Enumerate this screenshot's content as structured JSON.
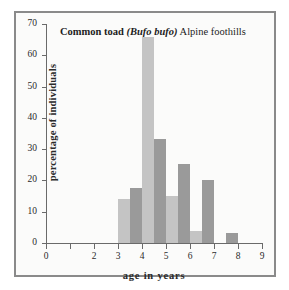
{
  "chart_data": {
    "type": "bar",
    "title": "Common toad (Bufo bufo) Alpine foothills",
    "title_parts": {
      "species_common": "Common toad",
      "species_latin": "(Bufo bufo)",
      "region": "Alpine foothills"
    },
    "xlabel": "age in years",
    "ylabel": "percentage of individuals",
    "xlim": [
      0,
      9
    ],
    "ylim": [
      0,
      70
    ],
    "grid": false,
    "legend": "none",
    "xticks": [
      0,
      1,
      2,
      3,
      4,
      5,
      6,
      7,
      8,
      9
    ],
    "xtick_labels": [
      "0",
      "",
      "2",
      "3",
      "4",
      "5",
      "6",
      "7",
      "8",
      "9"
    ],
    "yticks": [
      0,
      10,
      20,
      30,
      40,
      50,
      60,
      70
    ],
    "ytick_labels": [
      "0",
      "10",
      "20",
      "30",
      "40",
      "50",
      "60",
      "70"
    ],
    "colors": {
      "series_light": "#c4c4c4",
      "series_dark": "#9a9a9a",
      "axis": "#6a6a6a",
      "frame": "#8a8a8a",
      "plot_background": "#fbfbfa",
      "text": "#2a2a2a"
    },
    "bar_width_years": 0.5,
    "series": [
      {
        "name": "series-light",
        "color": "#c4c4c4",
        "bars": [
          {
            "x_start": 3.0,
            "value": 14.0
          },
          {
            "x_start": 4.0,
            "value": 66.0
          },
          {
            "x_start": 5.0,
            "value": 15.0
          },
          {
            "x_start": 6.0,
            "value": 3.7
          }
        ]
      },
      {
        "name": "series-dark",
        "color": "#9a9a9a",
        "bars": [
          {
            "x_start": 3.5,
            "value": 17.6
          },
          {
            "x_start": 4.5,
            "value": 33.2
          },
          {
            "x_start": 5.5,
            "value": 25.3
          },
          {
            "x_start": 6.5,
            "value": 20.1
          },
          {
            "x_start": 7.5,
            "value": 3.2
          }
        ]
      }
    ]
  }
}
